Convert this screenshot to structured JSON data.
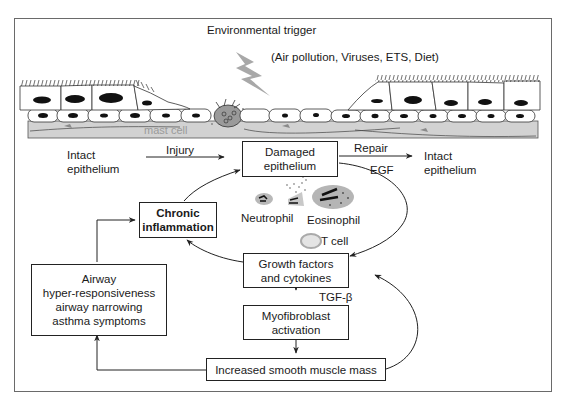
{
  "header": {
    "title": "Environmental trigger",
    "subtitle": "(Air pollution, Viruses, ETS, Diet)"
  },
  "tissue": {
    "mast_cell_label": "mast cell"
  },
  "flow": {
    "intact_left": [
      "Intact",
      "epithelium"
    ],
    "injury_label": "Injury",
    "damaged_box": [
      "Damaged",
      "epithelium"
    ],
    "repair_label": "Repair",
    "egf_label": "EGF",
    "intact_right": [
      "Intact",
      "epithelium"
    ],
    "chronic_box": [
      "Chronic",
      "inflammation"
    ],
    "neutrophil_label": "Neutrophil",
    "eosinophil_label": "Eosinophil",
    "tcell_label": "T cell",
    "growth_box": [
      "Growth factors",
      "and cytokines"
    ],
    "tgf_label": "TGF-β",
    "myofibroblast_box": [
      "Myofibroblast",
      "activation"
    ],
    "smooth_muscle_box": "Increased smooth muscle mass",
    "airway_box": [
      "Airway",
      "hyper-responsiveness",
      "airway narrowing",
      "asthma symptoms"
    ]
  },
  "colors": {
    "stroke": "#222222",
    "tissue_fill": "#cfcfcf",
    "cell_gray": "#b5b5b5",
    "frame": "#6a6a6a"
  }
}
